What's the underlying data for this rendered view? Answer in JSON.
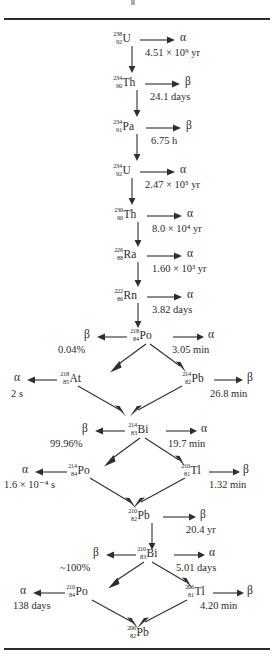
{
  "figure": {
    "type": "decay-chain-diagram",
    "title": "",
    "series_name": "Uranium-238 decay series"
  },
  "nuclides": [
    {
      "id": "u238",
      "mass": "238",
      "atomic": "92",
      "symbol": "U"
    },
    {
      "id": "th234",
      "mass": "234",
      "atomic": "90",
      "symbol": "Th"
    },
    {
      "id": "pa234",
      "mass": "234",
      "atomic": "91",
      "symbol": "Pa"
    },
    {
      "id": "u234",
      "mass": "234",
      "atomic": "92",
      "symbol": "U"
    },
    {
      "id": "th230",
      "mass": "230",
      "atomic": "90",
      "symbol": "Th"
    },
    {
      "id": "ra226",
      "mass": "226",
      "atomic": "88",
      "symbol": "Ra"
    },
    {
      "id": "rn222",
      "mass": "222",
      "atomic": "86",
      "symbol": "Rn"
    },
    {
      "id": "po218",
      "mass": "218",
      "atomic": "84",
      "symbol": "Po"
    },
    {
      "id": "at218",
      "mass": "218",
      "atomic": "85",
      "symbol": "At"
    },
    {
      "id": "pb214",
      "mass": "214",
      "atomic": "82",
      "symbol": "Pb"
    },
    {
      "id": "bi214",
      "mass": "214",
      "atomic": "83",
      "symbol": "Bi"
    },
    {
      "id": "po214",
      "mass": "214",
      "atomic": "84",
      "symbol": "Po"
    },
    {
      "id": "tl210",
      "mass": "210",
      "atomic": "81",
      "symbol": "Tl"
    },
    {
      "id": "pb210",
      "mass": "210",
      "atomic": "82",
      "symbol": "Pb"
    },
    {
      "id": "bi210",
      "mass": "210",
      "atomic": "83",
      "symbol": "Bi"
    },
    {
      "id": "po210",
      "mass": "210",
      "atomic": "84",
      "symbol": "Po"
    },
    {
      "id": "tl206",
      "mass": "206",
      "atomic": "81",
      "symbol": "Tl"
    },
    {
      "id": "pb206",
      "mass": "206",
      "atomic": "82",
      "symbol": "Pb"
    }
  ],
  "decays": [
    {
      "parent": "u238",
      "particle": "α",
      "halflife": "4.51",
      "mult": "×",
      "base": "10",
      "exp": "9",
      "unit": "yr"
    },
    {
      "parent": "th234",
      "particle": "β",
      "halflife": "24.1",
      "unit": "days"
    },
    {
      "parent": "pa234",
      "particle": "β",
      "halflife": "6.75",
      "unit": "h"
    },
    {
      "parent": "u234",
      "particle": "α",
      "halflife": "2.47",
      "mult": "×",
      "base": "10",
      "exp": "5",
      "unit": "yr"
    },
    {
      "parent": "th230",
      "particle": "α",
      "halflife": "8.0",
      "mult": "×",
      "base": "10",
      "exp": "4",
      "unit": "yr"
    },
    {
      "parent": "ra226",
      "particle": "α",
      "halflife": "1.60",
      "mult": "×",
      "base": "10",
      "exp": "3",
      "unit": "yr"
    },
    {
      "parent": "rn222",
      "particle": "α",
      "halflife": "3.82",
      "unit": "days"
    },
    {
      "parent": "po218",
      "particle": "β",
      "branch": "0.04%"
    },
    {
      "parent": "po218",
      "particle": "α",
      "halflife": "3.05",
      "unit": "min"
    },
    {
      "parent": "at218",
      "particle": "α",
      "halflife": "2",
      "unit": "s"
    },
    {
      "parent": "pb214",
      "particle": "β",
      "halflife": "26.8",
      "unit": "min"
    },
    {
      "parent": "bi214",
      "particle": "β",
      "branch": "99.96%"
    },
    {
      "parent": "bi214",
      "particle": "α",
      "halflife": "19.7",
      "unit": "min"
    },
    {
      "parent": "po214",
      "particle": "α",
      "halflife": "1.6",
      "mult": "×",
      "base": "10",
      "exp": "−4",
      "unit": "s"
    },
    {
      "parent": "tl210",
      "particle": "β",
      "halflife": "1.32",
      "unit": "min"
    },
    {
      "parent": "pb210",
      "particle": "β",
      "halflife": "20.4",
      "unit": "yr"
    },
    {
      "parent": "bi210",
      "particle": "β",
      "branch": "~100%"
    },
    {
      "parent": "bi210",
      "particle": "α",
      "halflife": "5.01",
      "unit": "days"
    },
    {
      "parent": "po210",
      "particle": "α",
      "halflife": "138",
      "unit": "days"
    },
    {
      "parent": "tl206",
      "particle": "β",
      "halflife": "4.20",
      "unit": "min"
    }
  ],
  "labels": {
    "u238": {
      "mass": "238",
      "atomic": "92",
      "symbol": "U"
    },
    "th234": {
      "mass": "234",
      "atomic": "90",
      "symbol": "Th"
    },
    "pa234": {
      "mass": "234",
      "atomic": "91",
      "symbol": "Pa"
    },
    "u234": {
      "mass": "234",
      "atomic": "92",
      "symbol": "U"
    },
    "th230": {
      "mass": "230",
      "atomic": "90",
      "symbol": "Th"
    },
    "ra226": {
      "mass": "226",
      "atomic": "88",
      "symbol": "Ra"
    },
    "rn222": {
      "mass": "222",
      "atomic": "86",
      "symbol": "Rn"
    },
    "po218": {
      "mass": "218",
      "atomic": "84",
      "symbol": "Po"
    },
    "at218": {
      "mass": "218",
      "atomic": "85",
      "symbol": "At"
    },
    "pb214": {
      "mass": "214",
      "atomic": "82",
      "symbol": "Pb"
    },
    "bi214": {
      "mass": "214",
      "atomic": "83",
      "symbol": "Bi"
    },
    "po214": {
      "mass": "214",
      "atomic": "84",
      "symbol": "Po"
    },
    "tl210": {
      "mass": "210",
      "atomic": "81",
      "symbol": "Tl"
    },
    "pb210": {
      "mass": "210",
      "atomic": "82",
      "symbol": "Pb"
    },
    "bi210": {
      "mass": "210",
      "atomic": "83",
      "symbol": "Bi"
    },
    "po210": {
      "mass": "210",
      "atomic": "84",
      "symbol": "Po"
    },
    "tl206": {
      "mass": "206",
      "atomic": "81",
      "symbol": "Tl"
    },
    "pb206": {
      "mass": "206",
      "atomic": "82",
      "symbol": "Pb"
    }
  },
  "particles": {
    "alpha": "α",
    "beta": "β"
  },
  "times": {
    "u238": "4.51 × 10⁹ yr",
    "th234": "24.1 days",
    "pa234": "6.75 h",
    "u234": "2.47 × 10⁵ yr",
    "th230": "8.0 × 10⁴ yr",
    "ra226": "1.60 × 10³ yr",
    "rn222": "3.82 days",
    "po218_alpha": "3.05 min",
    "po218_beta_pct": "0.04%",
    "at218": "2 s",
    "pb214": "26.8 min",
    "bi214_alpha": "19.7 min",
    "bi214_beta_pct": "99.96%",
    "po214": "1.6 × 10⁻⁴ s",
    "tl210": "1.32 min",
    "pb210": "20.4 yr",
    "bi210_alpha": "5.01 days",
    "bi210_beta_pct": "~100%",
    "po210": "138 days",
    "tl206": "4.20 min"
  },
  "time_parts": {
    "u238": {
      "num": "4.51",
      "mult": "×",
      "base": "10",
      "exp": "9",
      "unit": "yr"
    },
    "th234": {
      "num": "24.1",
      "unit": "days"
    },
    "pa234": {
      "num": "6.75",
      "unit": "h"
    },
    "u234": {
      "num": "2.47",
      "mult": "×",
      "base": "10",
      "exp": "5",
      "unit": "yr"
    },
    "th230": {
      "num": "8.0",
      "mult": "×",
      "base": "10",
      "exp": "4",
      "unit": "yr"
    },
    "ra226": {
      "num": "1.60",
      "mult": "×",
      "base": "10",
      "exp": "3",
      "unit": "yr"
    },
    "rn222": {
      "num": "3.82",
      "unit": "days"
    },
    "po218_alpha": {
      "num": "3.05",
      "unit": "min"
    },
    "at218": {
      "num": "2",
      "unit": "s"
    },
    "pb214": {
      "num": "26.8",
      "unit": "min"
    },
    "bi214_alpha": {
      "num": "19.7",
      "unit": "min"
    },
    "po214": {
      "num": "1.6",
      "mult": "×",
      "base": "10",
      "exp": "−4",
      "unit": "s"
    },
    "tl210": {
      "num": "1.32",
      "unit": "min"
    },
    "pb210": {
      "num": "20.4",
      "unit": "yr"
    },
    "bi210_alpha": {
      "num": "5.01",
      "unit": "days"
    },
    "po210": {
      "num": "138",
      "unit": "days"
    },
    "tl206": {
      "num": "4.20",
      "unit": "min"
    }
  },
  "colors": {
    "ink": "#2a2a2a",
    "rule": "#2b2b2b",
    "background": "#ffffff"
  }
}
